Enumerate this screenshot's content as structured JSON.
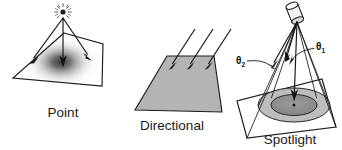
{
  "figure": {
    "background_color": "#ffffff",
    "ink_color": "#1c1c1c",
    "panels": [
      {
        "id": "point",
        "caption": "Point",
        "caption_x": 63,
        "caption_y": 117,
        "light_icon": "starburst-point-light-icon",
        "surface_shading": "radial-gradient-hotspot",
        "surface_fill_center": "#3a3a3a",
        "surface_fill_edge": "#ffffff",
        "ray_count": 3,
        "ray_pattern": "diverging"
      },
      {
        "id": "directional",
        "caption": "Directional",
        "caption_x": 172,
        "caption_y": 130,
        "light_icon": "parallel-rays-icon",
        "surface_shading": "uniform-gray",
        "surface_fill_center": "#b4b4b4",
        "surface_fill_edge": "#b4b4b4",
        "ray_count": 3,
        "ray_pattern": "parallel"
      },
      {
        "id": "spotlight",
        "caption": "Spotlight",
        "caption_x": 290,
        "caption_y": 142,
        "light_icon": "spotlight-housing-icon",
        "surface_shading": "concentric-cone-footprint",
        "penumbra_fill": "#b9b9b9",
        "umbra_fill": "#8e8e8e",
        "ray_count": 6,
        "ray_pattern": "cone",
        "angle_labels": [
          {
            "id": "theta-outer",
            "symbol": "θ",
            "subscript": "2",
            "x": 236,
            "y": 62
          },
          {
            "id": "theta-inner",
            "symbol": "θ",
            "subscript": "1",
            "x": 318,
            "y": 48
          }
        ]
      }
    ]
  }
}
